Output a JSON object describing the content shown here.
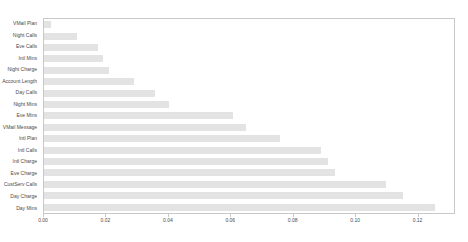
{
  "chart_data": {
    "type": "bar",
    "orientation": "horizontal",
    "title": "",
    "xlabel": "",
    "ylabel": "",
    "categories": [
      "VMail Plan",
      "Night Calls",
      "Eve Calls",
      "Intl Mins",
      "Night Charge",
      "Account Length",
      "Day Calls",
      "Night Mins",
      "Eve Mins",
      "VMail Message",
      "Intl Plan",
      "Intl Calls",
      "Intl Charge",
      "Eve Charge",
      "CustServ Calls",
      "Day Charge",
      "Day Mins"
    ],
    "values": [
      0.0022,
      0.0106,
      0.0173,
      0.0189,
      0.0209,
      0.0289,
      0.0356,
      0.0401,
      0.061,
      0.0651,
      0.0761,
      0.0892,
      0.0915,
      0.0937,
      0.1101,
      0.1155,
      0.1258
    ],
    "x_ticks": [
      "0.00",
      "0.02",
      "0.04",
      "0.06",
      "0.08",
      "0.10",
      "0.12"
    ],
    "x_tick_values": [
      0,
      0.02,
      0.04,
      0.06,
      0.08,
      0.1,
      0.12
    ],
    "xlim": [
      0,
      0.132
    ],
    "grid": "off",
    "legend": "none",
    "colors": {
      "bar": "#e3e3e3",
      "plot_border": "#c9c9c9",
      "tick_text": "#4a4a4a",
      "background": "#ffffff"
    }
  }
}
